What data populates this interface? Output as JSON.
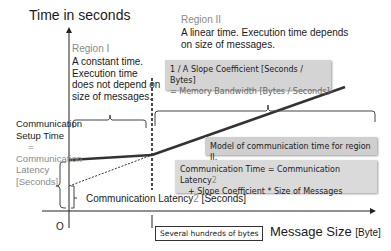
{
  "diagram": {
    "y_axis_label": "Time in seconds",
    "x_axis_label": "Message Size",
    "x_axis_unit": "[Byte]",
    "origin_label": "O",
    "region1": {
      "title": "Region I",
      "description": "A constant time. Execution time does not depend on size of messages."
    },
    "region2": {
      "title": "Region II",
      "description": "A linear time. Execution time depends on size of messages."
    },
    "setup_time": {
      "line1": "Communication Setup Time",
      "equals": "=",
      "line2": "Communication Latency [Seconds]"
    },
    "slope_box": {
      "line1": "1 / A Slope Coefficient  [Seconds / Bytes]",
      "line2": "=  Memory Bandwidth [Bytes / Seconds]"
    },
    "model_box": {
      "text": "Model of communication time for region II."
    },
    "equation_box": {
      "line1_a": "Communication Time = Communication Latency",
      "line1_sup": "2",
      "line2": "+ Slope Coefficient  * Size of Messages"
    },
    "latency2_label": {
      "text": "Communication Latency",
      "suffix": "2",
      "unit": " [Seconds]"
    },
    "threshold_label": "Several hundreds of bytes",
    "colors": {
      "accent_gray": "#8a8a8a",
      "box_fill": "#d4d4d4",
      "line": "#333333"
    }
  }
}
